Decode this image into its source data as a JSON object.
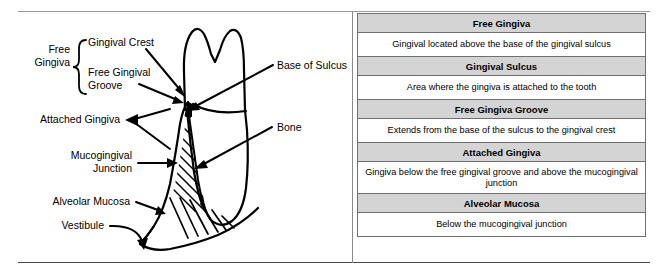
{
  "figure": {
    "colors": {
      "header_row_background": "#d4d4d4",
      "description_row_background": "#ffffff",
      "border": "#6f6f6f",
      "line_art": "#000000",
      "frame_rule": "#9a9a9a"
    }
  },
  "diagram": {
    "name": "tooth-gingiva-cross-section",
    "bracket_group_label": "Free\nGingiva",
    "labels": [
      {
        "id": "gingival-crest",
        "text": "Gingival Crest"
      },
      {
        "id": "free-gingival-groove",
        "text": "Free Gingival\nGroove"
      },
      {
        "id": "attached-gingiva",
        "text": "Attached Gingiva"
      },
      {
        "id": "mucogingival-junction",
        "text": "Mucogingival\nJunction"
      },
      {
        "id": "alveolar-mucosa",
        "text": "Alveolar Mucosa"
      },
      {
        "id": "vestibule",
        "text": "Vestibule"
      },
      {
        "id": "base-of-sulcus",
        "text": "Base of Sulcus"
      },
      {
        "id": "bone",
        "text": "Bone"
      }
    ]
  },
  "table": {
    "rows": [
      {
        "header": "Free Gingiva",
        "description": "Gingival located above the base of the gingival sulcus"
      },
      {
        "header": "Gingival Sulcus",
        "description": "Area where the gingiva is attached to the tooth"
      },
      {
        "header": "Free Gingiva Groove",
        "description": "Extends from the base of the sulcus to the gingival crest"
      },
      {
        "header": "Attached Gingiva",
        "description": "Gingiva below the free gingival groove and above the mucogingival junction"
      },
      {
        "header": "Alveolar Mucosa",
        "description": "Below the mucogingival junction"
      }
    ]
  }
}
